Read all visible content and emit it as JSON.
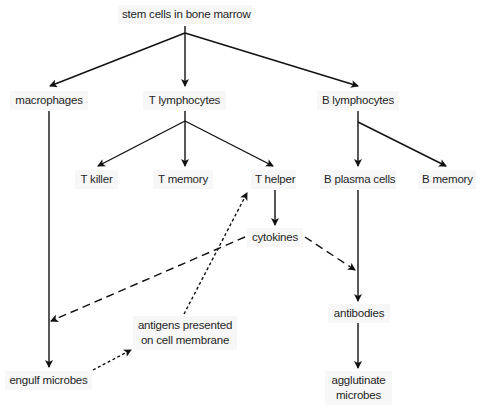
{
  "diagram": {
    "nodes": {
      "stem_cells": "stem cells in bone marrow",
      "macrophages": "macrophages",
      "t_lymphocytes": "T lymphocytes",
      "b_lymphocytes": "B lymphocytes",
      "t_killer": "T killer",
      "t_memory": "T memory",
      "t_helper": "T helper",
      "b_plasma_cells": "B plasma cells",
      "b_memory": "B memory",
      "cytokines": "cytokines",
      "antibodies": "antibodies",
      "antigens_line1": "antigens presented",
      "antigens_line2": "on cell membrane",
      "engulf_microbes": "engulf microbes",
      "agglutinate_line1": "agglutinate",
      "agglutinate_line2": "microbes"
    },
    "edges": [
      {
        "from": "stem_cells",
        "to": "macrophages",
        "style": "solid"
      },
      {
        "from": "stem_cells",
        "to": "t_lymphocytes",
        "style": "solid"
      },
      {
        "from": "stem_cells",
        "to": "b_lymphocytes",
        "style": "solid"
      },
      {
        "from": "t_lymphocytes",
        "to": "t_killer",
        "style": "solid"
      },
      {
        "from": "t_lymphocytes",
        "to": "t_memory",
        "style": "solid"
      },
      {
        "from": "t_lymphocytes",
        "to": "t_helper",
        "style": "solid"
      },
      {
        "from": "b_lymphocytes",
        "to": "b_plasma_cells",
        "style": "solid"
      },
      {
        "from": "b_lymphocytes",
        "to": "b_memory",
        "style": "solid"
      },
      {
        "from": "macrophages",
        "to": "engulf_microbes",
        "style": "solid"
      },
      {
        "from": "t_helper",
        "to": "cytokines",
        "style": "solid"
      },
      {
        "from": "b_plasma_cells",
        "to": "antibodies",
        "style": "solid"
      },
      {
        "from": "antibodies",
        "to": "agglutinate_microbes",
        "style": "solid"
      },
      {
        "from": "cytokines",
        "to": "macrophages_line",
        "style": "dashed"
      },
      {
        "from": "cytokines",
        "to": "b_plasma_line",
        "style": "dashed"
      },
      {
        "from": "engulf_microbes",
        "to": "antigens_presented",
        "style": "dotted"
      },
      {
        "from": "antigens_presented",
        "to": "t_helper",
        "style": "dotted"
      }
    ]
  }
}
